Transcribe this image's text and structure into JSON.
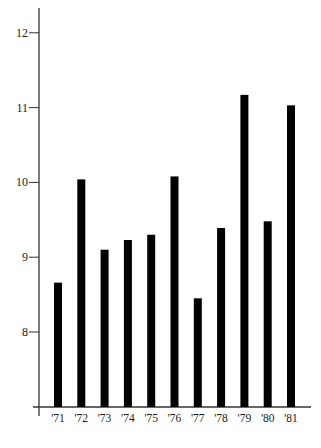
{
  "chart_data": {
    "type": "bar",
    "title": "",
    "xlabel": "",
    "ylabel": "",
    "categories": [
      "'71",
      "'72",
      "'73",
      "'74",
      "'75",
      "'76",
      "'77",
      "'78",
      "'79",
      "'80",
      "'81"
    ],
    "values": [
      8.66,
      10.04,
      9.1,
      9.23,
      9.3,
      10.08,
      8.45,
      9.39,
      11.17,
      9.48,
      11.03
    ],
    "y_ticks": [
      8,
      9,
      10,
      11,
      12
    ],
    "y_tick_labels": [
      "8",
      "9",
      "10",
      "11",
      "12"
    ],
    "ylim": [
      7,
      12.35
    ],
    "grid": false,
    "legend": null,
    "bar_color": "#000000",
    "axis_color": "#333333"
  }
}
